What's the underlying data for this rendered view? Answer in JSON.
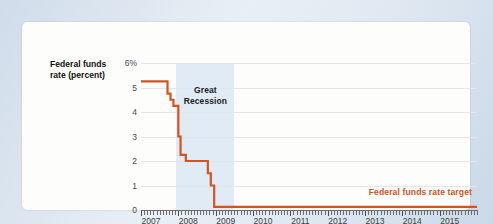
{
  "figure": {
    "axis_title_line1": "Federal funds",
    "axis_title_line2": "rate (percent)",
    "recession_label_line1": "Great",
    "recession_label_line2": "Recession",
    "series_annotation": "Federal funds rate target",
    "accent_color": "#d4541d",
    "recession_band_color": "#dee9f5",
    "grid_color": "#e2e6ec",
    "panel_color": "#fdfdfc"
  },
  "chart_data": {
    "type": "line",
    "title": "",
    "subtitle": "",
    "xlabel": "",
    "ylabel": "Federal funds rate (percent)",
    "grid": true,
    "legend_position": "inline-annotation",
    "xlim": [
      2007.0,
      2016.0
    ],
    "ylim": [
      0,
      6
    ],
    "yticks": [
      0,
      1,
      2,
      3,
      4,
      5,
      6
    ],
    "ytick_labels": [
      "0",
      "1",
      "2",
      "3",
      "4",
      "5",
      "6%"
    ],
    "xticks": [
      2007,
      2008,
      2009,
      2010,
      2011,
      2012,
      2013,
      2014,
      2015
    ],
    "xtick_labels": [
      "2007",
      "2008",
      "2009",
      "2010",
      "2011",
      "2012",
      "2013",
      "2014",
      "2015"
    ],
    "minor_xtick_interval_months": 1,
    "annotations": [
      {
        "text": "Great Recession",
        "type": "shaded-band",
        "x_start": 2007.95,
        "x_end": 2009.5,
        "color": "#dee9f5"
      },
      {
        "text": "Federal funds rate target",
        "type": "series-label",
        "x": 2013.1,
        "y": 0.72,
        "color": "#d4541d"
      }
    ],
    "series": [
      {
        "name": "Federal funds rate target",
        "color": "#d4541d",
        "line_width": 2.2,
        "step": true,
        "x": [
          2007.0,
          2007.71,
          2007.71,
          2007.79,
          2007.79,
          2007.87,
          2007.87,
          2008.0,
          2008.0,
          2008.06,
          2008.06,
          2008.2,
          2008.2,
          2008.29,
          2008.29,
          2008.37,
          2008.37,
          2008.79,
          2008.79,
          2008.87,
          2008.87,
          2008.96,
          2008.96,
          2016.0
        ],
        "y": [
          5.25,
          5.25,
          4.75,
          4.75,
          4.5,
          4.5,
          4.25,
          4.25,
          3.0,
          3.0,
          2.25,
          2.25,
          2.0,
          2.0,
          2.0,
          2.0,
          2.0,
          2.0,
          1.5,
          1.5,
          1.0,
          1.0,
          0.13,
          0.13
        ],
        "values_description": "Federal funds rate target, 2007-2015, percent"
      }
    ],
    "data_points": [
      {
        "date": "2007-01",
        "value": 5.25
      },
      {
        "date": "2007-09",
        "value": 4.75
      },
      {
        "date": "2007-10",
        "value": 4.5
      },
      {
        "date": "2007-12",
        "value": 4.25
      },
      {
        "date": "2008-01",
        "value": 3.0
      },
      {
        "date": "2008-02",
        "value": 3.0
      },
      {
        "date": "2008-03",
        "value": 2.25
      },
      {
        "date": "2008-04",
        "value": 2.0
      },
      {
        "date": "2008-09",
        "value": 2.0
      },
      {
        "date": "2008-10",
        "value": 1.0
      },
      {
        "date": "2008-12",
        "value": 0.13
      },
      {
        "date": "2009-12",
        "value": 0.13
      },
      {
        "date": "2010-12",
        "value": 0.13
      },
      {
        "date": "2011-12",
        "value": 0.13
      },
      {
        "date": "2012-12",
        "value": 0.13
      },
      {
        "date": "2013-12",
        "value": 0.13
      },
      {
        "date": "2014-12",
        "value": 0.13
      },
      {
        "date": "2015-12",
        "value": 0.13
      }
    ]
  }
}
